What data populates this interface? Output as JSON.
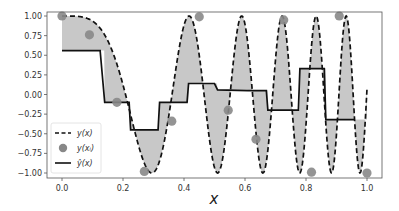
{
  "chart_data": {
    "type": "line",
    "title": "",
    "xlabel": "x",
    "ylabel": "",
    "xlim": [
      -0.05,
      1.05
    ],
    "ylim": [
      -1.05,
      1.05
    ],
    "grid": false,
    "legend_position": "lower left",
    "x_ticks": [
      0.0,
      0.2,
      0.4,
      0.6,
      0.8,
      1.0
    ],
    "x_tick_labels": [
      "0.0",
      "0.2",
      "0.4",
      "0.6",
      "0.8",
      "1.0"
    ],
    "y_ticks": [
      1.0,
      0.75,
      0.5,
      0.25,
      0.0,
      -0.25,
      -0.5,
      -0.75,
      -1.0
    ],
    "y_tick_labels": [
      "1.00",
      "0.75",
      "0.50",
      "0.25",
      "0.00",
      "−0.25",
      "−0.50",
      "−0.75",
      "−1.00"
    ],
    "series": [
      {
        "name": "y(x)",
        "style": "dashed",
        "color": "#111111",
        "description": "cos(2π x² · k) style chirp: cos(a x^2) with a ≈ 36"
      },
      {
        "name": "y(x_i)",
        "style": "markers",
        "color": "#888888",
        "x": [
          0.0,
          0.09,
          0.18,
          0.27,
          0.36,
          0.45,
          0.545,
          0.636,
          0.727,
          0.818,
          0.909,
          1.0
        ],
        "y": [
          1.0,
          0.76,
          -0.1,
          -0.98,
          -0.34,
          0.99,
          -0.2,
          -0.57,
          0.95,
          -0.99,
          1.0,
          -1.0
        ]
      },
      {
        "name": "ŷ(x)",
        "style": "solid-step",
        "color": "#111111",
        "x": [
          0.0,
          0.125,
          0.14,
          0.22,
          0.225,
          0.315,
          0.32,
          0.38,
          0.385,
          0.41,
          0.415,
          0.5,
          0.51,
          0.61,
          0.615,
          0.67,
          0.675,
          0.75,
          0.755,
          0.775,
          0.78,
          0.86,
          0.865,
          0.96
        ],
        "y": [
          0.56,
          0.56,
          -0.1,
          -0.1,
          -0.45,
          -0.45,
          -0.1,
          -0.1,
          -0.1,
          -0.1,
          0.14,
          0.14,
          0.06,
          0.05,
          0.05,
          0.05,
          -0.2,
          -0.2,
          -0.2,
          -0.2,
          0.33,
          0.33,
          -0.32,
          -0.32
        ]
      }
    ],
    "fill_between": {
      "between": [
        "y(x)",
        "ŷ(x)"
      ],
      "color": "#c8c8c8"
    }
  },
  "legend": {
    "items": [
      {
        "label": "y(x)",
        "symbol": "dashed-line"
      },
      {
        "label": "y(xᵢ)",
        "symbol": "circle-marker"
      },
      {
        "label": "ŷ(x)",
        "symbol": "solid-line"
      }
    ]
  },
  "colors": {
    "fill": "#c8c8c8",
    "marker": "#888888",
    "line": "#111111",
    "frame": "#555555"
  }
}
